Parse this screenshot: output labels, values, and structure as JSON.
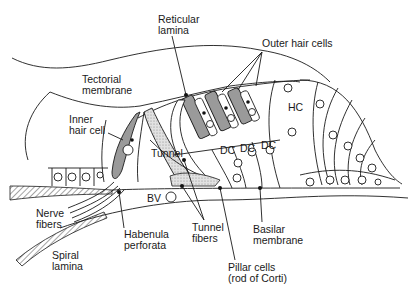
{
  "figure": {
    "labels": [
      {
        "id": "reticular-lamina",
        "line1": "Reticular",
        "line2": "lamina",
        "x": 158,
        "y": 14
      },
      {
        "id": "outer-hair-cells",
        "line1": "Outer hair cells",
        "line2": "",
        "x": 262,
        "y": 38
      },
      {
        "id": "tectorial-membrane",
        "line1": "Tectorial",
        "line2": "membrane",
        "x": 82,
        "y": 74
      },
      {
        "id": "inner-hair-cell",
        "line1": "Inner",
        "line2": "hair cell",
        "x": 69,
        "y": 114
      },
      {
        "id": "hc",
        "line1": "HC",
        "line2": "",
        "x": 288,
        "y": 102
      },
      {
        "id": "tunnel",
        "line1": "Tunnel",
        "line2": "",
        "x": 151,
        "y": 148
      },
      {
        "id": "dc-1",
        "line1": "DC",
        "line2": "",
        "x": 220,
        "y": 145
      },
      {
        "id": "dc-2",
        "line1": "DC",
        "line2": "",
        "x": 240,
        "y": 143
      },
      {
        "id": "dc-3",
        "line1": "DC",
        "line2": "",
        "x": 261,
        "y": 140
      },
      {
        "id": "bv",
        "line1": "BV",
        "line2": "",
        "x": 147,
        "y": 198
      },
      {
        "id": "nerve-fibers",
        "line1": "Nerve",
        "line2": "fibers",
        "x": 36,
        "y": 208
      },
      {
        "id": "tunnel-fibers",
        "line1": "Tunnel",
        "line2": "fibers",
        "x": 192,
        "y": 222
      },
      {
        "id": "basilar-membrane",
        "line1": "Basilar",
        "line2": "membrane",
        "x": 253,
        "y": 224
      },
      {
        "id": "habenula-perforata",
        "line1": "Habenula",
        "line2": "perforata",
        "x": 124,
        "y": 229
      },
      {
        "id": "spiral-lamina",
        "line1": "Spiral",
        "line2": "lamina",
        "x": 52,
        "y": 250
      },
      {
        "id": "pillar-cells",
        "line1": "Pillar cells",
        "line2": "(rod of Corti)",
        "x": 228,
        "y": 262
      }
    ]
  },
  "colors": {
    "line": "#1a1a1a",
    "hair_cell_fill": "#9a9a9a",
    "stipple_fill": "#d6d6d6",
    "background": "#ffffff"
  }
}
